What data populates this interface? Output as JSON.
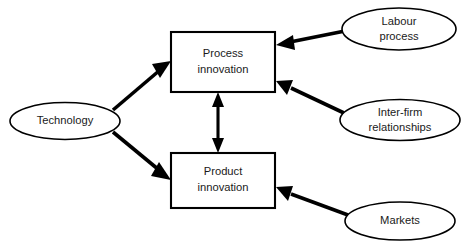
{
  "diagram": {
    "background_color": "#ffffff",
    "stroke_color": "#000000",
    "text_color": "#1a1a1a",
    "nodes": {
      "technology": {
        "label": "Technology",
        "shape": "ellipse"
      },
      "process_innovation": {
        "label_line1": "Process",
        "label_line2": "innovation",
        "shape": "rectangle"
      },
      "product_innovation": {
        "label_line1": "Product",
        "label_line2": "innovation",
        "shape": "rectangle"
      },
      "labour_process": {
        "label_line1": "Labour",
        "label_line2": "process",
        "shape": "ellipse"
      },
      "inter_firm_relationships": {
        "label_line1": "Inter-firm",
        "label_line2": "relationships",
        "shape": "ellipse"
      },
      "markets": {
        "label": "Markets",
        "shape": "ellipse"
      }
    },
    "edges": [
      {
        "name": "technology-to-process-innovation",
        "from": "technology",
        "to": "process_innovation",
        "direction": "one-way"
      },
      {
        "name": "technology-to-product-innovation",
        "from": "technology",
        "to": "product_innovation",
        "direction": "one-way"
      },
      {
        "name": "labour-process-to-process-innovation",
        "from": "labour_process",
        "to": "process_innovation",
        "direction": "one-way"
      },
      {
        "name": "inter-firm-relationships-to-process-innovation",
        "from": "inter_firm_relationships",
        "to": "process_innovation",
        "direction": "one-way"
      },
      {
        "name": "markets-to-product-innovation",
        "from": "markets",
        "to": "product_innovation",
        "direction": "one-way"
      },
      {
        "name": "process-innovation-to-product-innovation",
        "from": "process_innovation",
        "to": "product_innovation",
        "direction": "two-way"
      }
    ]
  }
}
